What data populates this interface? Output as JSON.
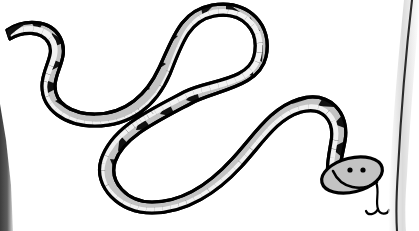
{
  "page": {
    "type": "scanned-illustration",
    "width": 419,
    "height": 231,
    "background_color": "#ffffff",
    "caption": "Snake line drawing",
    "subject": "snake"
  },
  "colors": {
    "paper": "#ffffff",
    "ink": "#000000",
    "body_fill": "#c3c3c3",
    "body_shadow": "#a9a9a9",
    "belly_scale_fill": "#f2f2f2",
    "marking_fill": "#111111",
    "page_edge_dark": "#4a4a4a",
    "page_edge_mid": "#6e6e6e",
    "page_edge_light": "#bdbdbd"
  },
  "artwork": {
    "title": "Snake",
    "description": "A long S-curved snake drawn in black outline with a light gray body, black triangular back markings and a segmented pale belly.",
    "style": "black and white clip-art line drawing",
    "orientation": "tail at upper left, head at lower right",
    "stroke_width": 3.2,
    "body_path": "M 7 32 C 26 21 48 22 57 39 C 66 57 52 72 52 86 C 52 106 70 118 95 118 C 128 118 150 96 162 70 C 176 40 182 14 212 9 C 246 3 268 28 262 56 C 256 84 214 86 188 100 C 150 120 118 136 110 162 C 103 186 124 207 152 207 C 186 207 214 186 236 162 C 258 138 272 112 300 104 C 326 97 344 116 340 140 C 336 163 330 170 336 178",
    "body_widths": [
      {
        "t": 0.0,
        "w": 3
      },
      {
        "t": 0.06,
        "w": 9
      },
      {
        "t": 0.2,
        "w": 13
      },
      {
        "t": 0.4,
        "w": 19
      },
      {
        "t": 0.62,
        "w": 25
      },
      {
        "t": 0.82,
        "w": 30
      },
      {
        "t": 0.95,
        "w": 31
      },
      {
        "t": 1.0,
        "w": 28
      }
    ],
    "back_markings": {
      "shape": "triangle",
      "count": 24,
      "color": "#111111",
      "edge": "outer / dorsal",
      "note": "triangles point inward from the back edge toward the body centre"
    },
    "belly_scales": {
      "shape": "rectangular segments",
      "count": 58,
      "fill": "#f2f2f2",
      "edge": "inner / ventral",
      "note": "a pale banded strip of small rectangles runs along the belly"
    },
    "head": {
      "position": {
        "x": 352,
        "y": 175
      },
      "width": 62,
      "height": 34,
      "rotation_deg": -14,
      "features": [
        "left-eye",
        "right-eye",
        "smiling-mouth",
        "forked-tongue"
      ],
      "eyes": [
        {
          "name": "left-eye",
          "x": 350,
          "y": 172,
          "r": 2.4
        },
        {
          "name": "right-eye",
          "x": 363,
          "y": 172,
          "r": 2.4
        }
      ],
      "mouth": {
        "name": "smiling-mouth",
        "path": "M 336 170 C 342 187 362 191 375 184"
      },
      "tongue": {
        "name": "forked-tongue",
        "path": "M 374 184 C 379 193 376 202 379 210 C 381 216 388 216 390 212",
        "fork_path": "M 379 210 C 376 216 369 217 367 213",
        "stroke_width": 2.2
      }
    },
    "tail": {
      "name": "tail-tip",
      "position": {
        "x": 7,
        "y": 32
      },
      "shape": "tapered point"
    }
  },
  "scan_artifacts": [
    {
      "name": "left-page-edge-shadow",
      "side": "left",
      "description": "dark gray vertical wedge along the lower left margin",
      "color": "#4a4a4a",
      "geometry": "M 0 106 L 11 150 L 14 231 L 0 231 Z"
    },
    {
      "name": "right-page-edge-line",
      "side": "right",
      "description": "thin curved dark line of the facing page edge",
      "color": "#2b2b2b",
      "geometry": "M 412 0 C 406 50 401 110 398 170 C 396 200 396 216 397 231"
    },
    {
      "name": "right-page-edge-fade",
      "side": "right",
      "description": "soft gray halo beside the right page edge",
      "color": "#bdbdbd"
    }
  ]
}
